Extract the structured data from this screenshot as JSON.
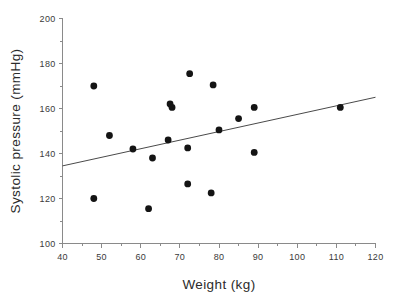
{
  "chart_data": {
    "type": "scatter",
    "title": "",
    "xlabel": "Weight  (kg)",
    "ylabel": "Systolic pressure  (mmHg)",
    "xlim": [
      40,
      120
    ],
    "ylim": [
      100,
      200
    ],
    "xticks": [
      40,
      50,
      60,
      70,
      80,
      90,
      100,
      110,
      120
    ],
    "yticks": [
      100,
      120,
      140,
      160,
      180,
      200
    ],
    "xtick_labels": [
      "40",
      "50",
      "60",
      "70",
      "80",
      "90",
      "100",
      "110",
      "120"
    ],
    "ytick_labels": [
      "100",
      "120",
      "140",
      "160",
      "180",
      "200"
    ],
    "grid": false,
    "legend": null,
    "marker": "filled-circle",
    "marker_color": "#141414",
    "marker_size": 4,
    "x": [
      48,
      48,
      52,
      58,
      62,
      63,
      67,
      67.5,
      68,
      72,
      72,
      72.5,
      78,
      78.5,
      80,
      85,
      89,
      89,
      111
    ],
    "y": [
      170,
      120,
      148,
      142,
      115.5,
      138,
      146,
      162,
      160.5,
      142.5,
      126.5,
      175.5,
      122.5,
      170.5,
      150.5,
      155.5,
      160.5,
      140.5,
      160.5
    ],
    "points": [
      {
        "x": 48,
        "y": 170
      },
      {
        "x": 48,
        "y": 120
      },
      {
        "x": 52,
        "y": 148
      },
      {
        "x": 58,
        "y": 142
      },
      {
        "x": 62,
        "y": 115.5
      },
      {
        "x": 63,
        "y": 138
      },
      {
        "x": 67,
        "y": 146
      },
      {
        "x": 67.5,
        "y": 162
      },
      {
        "x": 68,
        "y": 160.5
      },
      {
        "x": 72,
        "y": 142.5
      },
      {
        "x": 72,
        "y": 126.5
      },
      {
        "x": 72.5,
        "y": 175.5
      },
      {
        "x": 78,
        "y": 122.5
      },
      {
        "x": 78.5,
        "y": 170.5
      },
      {
        "x": 80,
        "y": 150.5
      },
      {
        "x": 85,
        "y": 155.5
      },
      {
        "x": 89,
        "y": 160.5
      },
      {
        "x": 89,
        "y": 140.5
      },
      {
        "x": 111,
        "y": 160.5
      }
    ],
    "trendline": {
      "name": "least-squares fit",
      "x0": 40,
      "y0": 134.5,
      "x1": 120,
      "y1": 165,
      "color": "#4a4a4a"
    }
  },
  "axes": {
    "x_title": "Weight  (kg)",
    "y_title": "Systolic pressure  (mmHg)"
  }
}
